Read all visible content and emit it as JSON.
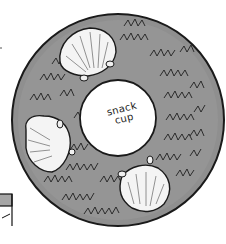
{
  "illustration": {
    "subject": "round snack tray with seashells",
    "center_label": {
      "line1": "snack",
      "line2": "cup"
    },
    "elements": {
      "tray": "ring-shaped tray with zigzag seaweed texture",
      "shells": [
        "top-left shell",
        "left shell",
        "bottom-right shell"
      ],
      "edge_fragment": "partial box drawing at left edge"
    },
    "colors": {
      "tray_fill": "#8e8e8e",
      "tray_outline": "#1a1a1a",
      "center_fill": "#ffffff",
      "shell_fill": "#f4f4f4",
      "zigzag_stroke": "#222222",
      "background": "#ffffff"
    }
  }
}
